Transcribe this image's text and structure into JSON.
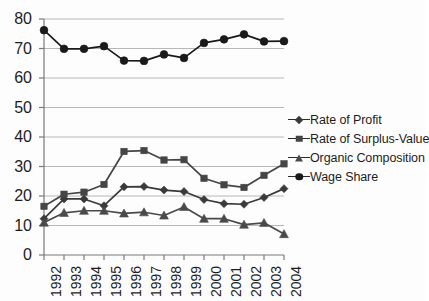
{
  "chart_data": {
    "type": "line",
    "title": "",
    "subtitle": "",
    "xlabel": "",
    "ylabel": "",
    "categories": [
      "1992",
      "1993",
      "1994",
      "1995",
      "1996",
      "1997",
      "1998",
      "1999",
      "2000",
      "2001",
      "2002",
      "2003",
      "2004"
    ],
    "x": [
      1992,
      1993,
      1994,
      1995,
      1996,
      1997,
      1998,
      1999,
      2000,
      2001,
      2002,
      2003,
      2004
    ],
    "ylim": [
      0,
      80
    ],
    "ytick_values": [
      0,
      10,
      20,
      30,
      40,
      50,
      60,
      70,
      80
    ],
    "ytick_labels": [
      "0",
      "10",
      "20",
      "30",
      "40",
      "50",
      "60",
      "70",
      "80"
    ],
    "grid": true,
    "grid_axis": "y",
    "legend_position": "right",
    "series": [
      {
        "name": "Rate of Profit",
        "marker": "diamond",
        "color": "#3a3a3a",
        "values": [
          12.3,
          19.0,
          19.0,
          16.7,
          23.1,
          23.2,
          22.0,
          21.5,
          18.8,
          17.4,
          17.2,
          19.5,
          22.5
        ]
      },
      {
        "name": "Rate of Surplus-Value",
        "marker": "square",
        "color": "#454545",
        "values": [
          16.5,
          20.6,
          21.3,
          23.9,
          35.1,
          35.4,
          32.2,
          32.3,
          26.0,
          23.8,
          22.9,
          27.0,
          30.9
        ]
      },
      {
        "name": "Organic Composition",
        "marker": "triangle",
        "color": "#4a4a4a",
        "values": [
          11.0,
          14.3,
          15.0,
          15.0,
          14.1,
          14.5,
          13.4,
          16.3,
          12.3,
          12.3,
          10.3,
          10.9,
          7.1
        ]
      },
      {
        "name": "Wage Share",
        "marker": "circle",
        "color": "#1a1a1a",
        "values": [
          76.2,
          69.9,
          69.9,
          70.8,
          65.9,
          65.8,
          68.0,
          66.8,
          71.9,
          73.1,
          74.8,
          72.4,
          72.5
        ]
      }
    ]
  },
  "axis": {
    "y_labels": [
      "80",
      "70",
      "60",
      "50",
      "40",
      "30",
      "20",
      "10",
      "0"
    ],
    "x_labels": [
      "1992",
      "1993",
      "1994",
      "1995",
      "1996",
      "1997",
      "1998",
      "1999",
      "2000",
      "2001",
      "2002",
      "2003",
      "2004"
    ]
  },
  "legend": {
    "items": [
      {
        "label": "Rate of Profit",
        "marker": "diamond"
      },
      {
        "label": "Rate of Surplus-Value",
        "marker": "square"
      },
      {
        "label": "Organic Composition",
        "marker": "triangle"
      },
      {
        "label": "Wage Share",
        "marker": "circle"
      }
    ]
  },
  "colors": {
    "line": "#2b2b2b",
    "grid": "#b8b8b8",
    "axis": "#7a7a7a",
    "text": "#1d1d1d",
    "background": "#fdfdfd"
  }
}
